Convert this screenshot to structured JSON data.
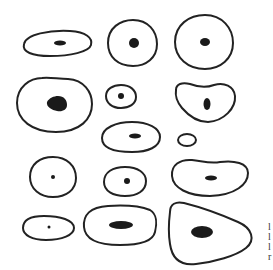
{
  "figure": {
    "stroke_color": "#222222",
    "nucleus_color": "#1a1a1a",
    "cells": [
      {
        "id": 1,
        "shape": "flat-ellipse",
        "cx": 57,
        "cy": 43,
        "rx": 34,
        "ry": 13,
        "nx": 60,
        "ny": 43,
        "nrx": 6,
        "nry": 2.5
      },
      {
        "id": 2,
        "shape": "circle",
        "cx": 132,
        "cy": 43,
        "rx": 25,
        "ry": 23,
        "nx": 134,
        "ny": 43,
        "nrx": 5,
        "nry": 5
      },
      {
        "id": 3,
        "shape": "circle",
        "cx": 204,
        "cy": 42,
        "rx": 29,
        "ry": 27,
        "nx": 205,
        "ny": 42,
        "nrx": 5,
        "nry": 4
      },
      {
        "id": 4,
        "shape": "large-blob",
        "cx": 54,
        "cy": 103,
        "rx": 38,
        "ry": 29,
        "nx": 57,
        "ny": 103,
        "nrx": 11,
        "nry": 8
      },
      {
        "id": 5,
        "shape": "small-oval",
        "cx": 121,
        "cy": 96,
        "rx": 15,
        "ry": 11,
        "nx": 121,
        "ny": 96,
        "nrx": 3,
        "nry": 3
      },
      {
        "id": 6,
        "shape": "heart-blob",
        "cx": 205,
        "cy": 99,
        "rx": 30,
        "ry": 20,
        "nx": 207,
        "ny": 104,
        "nrx": 3.5,
        "nry": 6
      },
      {
        "id": 7,
        "shape": "oval",
        "cx": 131,
        "cy": 137,
        "rx": 29,
        "ry": 14,
        "nx": 135,
        "ny": 136,
        "nrx": 6,
        "nry": 2.5
      },
      {
        "id": 8,
        "shape": "tiny-oval",
        "cx": 187,
        "cy": 140,
        "rx": 9,
        "ry": 6,
        "nx": null,
        "ny": null,
        "nrx": 0,
        "nry": 0
      },
      {
        "id": 9,
        "shape": "circle",
        "cx": 53,
        "cy": 177,
        "rx": 23,
        "ry": 19,
        "nx": 53,
        "ny": 177,
        "nrx": 2,
        "nry": 2
      },
      {
        "id": 10,
        "shape": "oval",
        "cx": 125,
        "cy": 181,
        "rx": 21,
        "ry": 15,
        "nx": 127,
        "ny": 181,
        "nrx": 3,
        "nry": 3
      },
      {
        "id": 11,
        "shape": "kidney",
        "cx": 210,
        "cy": 177,
        "rx": 38,
        "ry": 19,
        "nx": 211,
        "ny": 178,
        "nrx": 6,
        "nry": 2.5
      },
      {
        "id": 12,
        "shape": "egg",
        "cx": 48,
        "cy": 227,
        "rx": 25,
        "ry": 12,
        "nx": 49,
        "ny": 227,
        "nrx": 1.5,
        "nry": 1.5
      },
      {
        "id": 13,
        "shape": "rounded-rect",
        "cx": 120,
        "cy": 225,
        "rx": 36,
        "ry": 19,
        "nx": 121,
        "ny": 225,
        "nrx": 12,
        "nry": 4
      },
      {
        "id": 14,
        "shape": "triangle-blob",
        "cx": 209,
        "cy": 232,
        "rx": 42,
        "ry": 33,
        "nx": 202,
        "ny": 232,
        "nrx": 11,
        "nry": 6
      }
    ]
  },
  "edge_text": {
    "lines": [
      "l",
      "l",
      "l",
      "r"
    ]
  }
}
